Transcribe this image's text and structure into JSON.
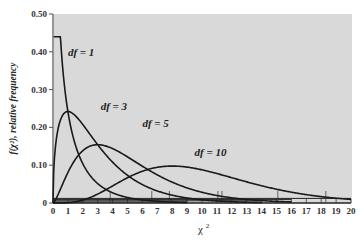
{
  "chart_data": {
    "type": "line",
    "title": "",
    "xlabel": "χ",
    "xlabel_sup": "2",
    "ylabel": "f(χ²), relative frequency",
    "xlim": [
      0,
      20
    ],
    "ylim": [
      0,
      0.5
    ],
    "x_ticks": [
      "0",
      "1",
      "2",
      "3",
      "4",
      "5",
      "6",
      "7",
      "8",
      "9",
      "10",
      "11",
      "12",
      "13",
      "14",
      "15",
      "16",
      "17",
      "18",
      "19",
      "20"
    ],
    "y_ticks": [
      {
        "value": 0,
        "label": "0"
      },
      {
        "value": 0.1,
        "label": "0.10"
      },
      {
        "value": 0.2,
        "label": "0.20"
      },
      {
        "value": 0.3,
        "label": "0.30"
      },
      {
        "value": 0.4,
        "label": "0.40"
      },
      {
        "value": 0.5,
        "label": "0.50"
      }
    ],
    "grid": false,
    "background": "#d9d9d9",
    "line_color": "#1a1a1a",
    "series": [
      {
        "name": "df = 1",
        "df": 1,
        "x_range": [
          0.04,
          9
        ],
        "x": [
          0.04,
          0.1,
          0.25,
          0.5,
          1,
          1.5,
          2,
          3,
          4,
          5,
          6,
          7,
          8,
          9
        ],
        "y": [
          0.439,
          0.381,
          0.27,
          0.22,
          0.242,
          0.154,
          0.104,
          0.051,
          0.027,
          0.015,
          0.008,
          0.005,
          0.003,
          0.001
        ]
      },
      {
        "name": "df = 3",
        "df": 3,
        "x_range": [
          0,
          14
        ],
        "x": [
          0,
          0.5,
          1,
          1.5,
          2,
          3,
          4,
          5,
          6,
          7,
          8,
          9,
          10,
          12,
          14
        ],
        "y": [
          0,
          0.22,
          0.242,
          0.231,
          0.208,
          0.154,
          0.108,
          0.073,
          0.048,
          0.032,
          0.021,
          0.013,
          0.008,
          0.003,
          0.001
        ]
      },
      {
        "name": "df = 5",
        "df": 5,
        "x_range": [
          0,
          16
        ],
        "x": [
          0,
          1,
          2,
          3,
          4,
          5,
          6,
          7,
          8,
          9,
          10,
          12,
          14,
          16
        ],
        "y": [
          0,
          0.081,
          0.138,
          0.154,
          0.144,
          0.122,
          0.096,
          0.072,
          0.052,
          0.036,
          0.025,
          0.011,
          0.005,
          0.002
        ]
      },
      {
        "name": "df = 10",
        "df": 10,
        "x_range": [
          0,
          20
        ],
        "x": [
          0,
          1,
          2,
          3,
          4,
          5,
          6,
          7,
          8,
          9,
          10,
          11,
          12,
          13,
          14,
          15,
          16,
          17,
          18,
          19,
          20
        ],
        "y": [
          0,
          0.001,
          0.008,
          0.025,
          0.045,
          0.067,
          0.084,
          0.095,
          0.098,
          0.094,
          0.088,
          0.078,
          0.067,
          0.056,
          0.046,
          0.036,
          0.029,
          0.022,
          0.017,
          0.012,
          0.009
        ]
      }
    ],
    "annotations": [
      {
        "text": "df = 1",
        "series": "df = 1"
      },
      {
        "text": "df = 3",
        "series": "df = 3"
      },
      {
        "text": "df = 5",
        "series": "df = 5"
      },
      {
        "text": "df = 10",
        "series": "df = 10"
      }
    ],
    "critical_markers": [
      {
        "series": "df = 1",
        "x": [
          3.84,
          6.63
        ]
      },
      {
        "series": "df = 3",
        "x": [
          7.81,
          11.34
        ]
      },
      {
        "series": "df = 5",
        "x": [
          11.07,
          15.09
        ]
      },
      {
        "series": "df = 10",
        "x": [
          18.31
        ]
      }
    ]
  }
}
